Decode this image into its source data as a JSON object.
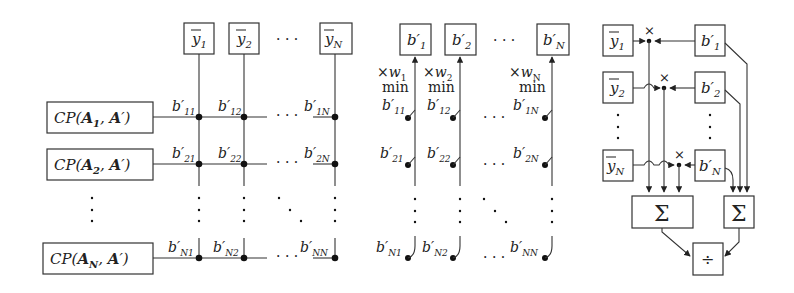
{
  "left_panel": {
    "top_boxes": [
      "ȳ1",
      "ȳ2",
      "ȳN"
    ],
    "top_ellipsis": "· · ·",
    "row_boxes": [
      "CP(A1, A′)",
      "CP(A2, A′)",
      "CP(AN, A′)"
    ],
    "row_boxes_parts": [
      {
        "prefix": "CP(",
        "sub_main": "A",
        "sub": "1",
        "suffix": ", A′)"
      },
      {
        "prefix": "CP(",
        "sub_main": "A",
        "sub": "2",
        "suffix": ", A′)"
      },
      {
        "prefix": "CP(",
        "sub_main": "A",
        "sub": "N",
        "suffix": ", A′)"
      }
    ],
    "node_labels": [
      [
        "b′11",
        "b′12",
        "b′1N"
      ],
      [
        "b′21",
        "b′22",
        "b′2N"
      ],
      [
        "b′N1",
        "b′N2",
        "b′NN"
      ]
    ],
    "node_subs": [
      [
        "11",
        "12",
        "1N"
      ],
      [
        "21",
        "22",
        "2N"
      ],
      [
        "N1",
        "N2",
        "NN"
      ]
    ],
    "row_ellipsis": "· · ·"
  },
  "middle_panel": {
    "top_boxes_subs": [
      "1",
      "2",
      "N"
    ],
    "top_ellipsis": "· · ·",
    "weights": [
      "×w1",
      "×w2",
      "×wN"
    ],
    "weight_subs": [
      "1",
      "2",
      "N"
    ],
    "op_label": "min",
    "switch_subs": [
      [
        "11",
        "12",
        "1N"
      ],
      [
        "21",
        "22",
        "2N"
      ],
      [
        "N1",
        "N2",
        "NN"
      ]
    ],
    "row_ellipsis": "· · ·"
  },
  "right_panel": {
    "y_boxes_subs": [
      "1",
      "2",
      "N"
    ],
    "b_boxes_subs": [
      "1",
      "2",
      "N"
    ],
    "multiply_symbol": "×",
    "sum_symbol": "Σ",
    "divide_symbol": "÷"
  }
}
